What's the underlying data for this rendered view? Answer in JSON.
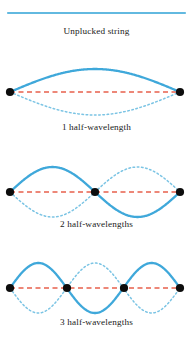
{
  "figure": {
    "width": 193,
    "height": 338,
    "background": "#ffffff"
  },
  "colors": {
    "string_solid": "#3fa8da",
    "string_dotted": "#7bc4e4",
    "unplucked_string": "#62b9e0",
    "axis_dashed": "#e8604c",
    "node_dot": "#0d0d0d",
    "caption_text": "#1a1a1a"
  },
  "panels": [
    {
      "id": "unplucked",
      "caption": "Unplucked string",
      "harmonic": 0,
      "half_wavelengths": 0,
      "nodes": [],
      "axis_y": 13,
      "amplitude": 0,
      "string_x_start": 8,
      "string_x_end": 185,
      "has_dashed_axis": false,
      "has_dotted_mirror": false
    },
    {
      "id": "first-harmonic",
      "caption": "1 half-wavelength",
      "harmonic": 1,
      "half_wavelengths": 1,
      "nodes": [
        10,
        180
      ],
      "axis_y": 92,
      "amplitude": 23,
      "string_x_start": 10,
      "string_x_end": 180,
      "has_dashed_axis": true,
      "has_dotted_mirror": true
    },
    {
      "id": "second-harmonic",
      "caption": "2 half-wavelengths",
      "harmonic": 2,
      "half_wavelengths": 2,
      "nodes": [
        10,
        95,
        180
      ],
      "axis_y": 192,
      "amplitude": 25,
      "string_x_start": 10,
      "string_x_end": 180,
      "has_dashed_axis": true,
      "has_dotted_mirror": true
    },
    {
      "id": "third-harmonic",
      "caption": "3 half-wavelengths",
      "harmonic": 3,
      "half_wavelengths": 3,
      "nodes": [
        10,
        67,
        124,
        180
      ],
      "axis_y": 288,
      "amplitude": 25,
      "string_x_start": 10,
      "string_x_end": 180,
      "has_dashed_axis": true,
      "has_dotted_mirror": true
    }
  ],
  "chart_data": {
    "type": "line",
    "xlabel": "",
    "ylabel": "",
    "series": [
      {
        "name": "Unplucked string",
        "half_wavelengths": 0,
        "nodes_x": [],
        "antinode_count": 0,
        "amplitude": 0
      },
      {
        "name": "1 half-wavelength",
        "half_wavelengths": 1,
        "nodes_x": [
          10,
          180
        ],
        "antinode_count": 1,
        "amplitude": 23
      },
      {
        "name": "2 half-wavelengths",
        "half_wavelengths": 2,
        "nodes_x": [
          10,
          95,
          180
        ],
        "antinode_count": 2,
        "amplitude": 25
      },
      {
        "name": "3 half-wavelengths",
        "half_wavelengths": 3,
        "nodes_x": [
          10,
          67,
          124,
          180
        ],
        "antinode_count": 3,
        "amplitude": 25
      }
    ],
    "legend": [],
    "grid": false
  }
}
